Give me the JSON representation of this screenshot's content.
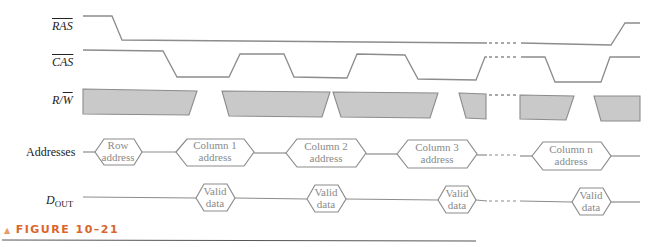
{
  "signals": {
    "ras": {
      "label": "RAS",
      "overbar": true
    },
    "cas": {
      "label": "CAS",
      "overbar": true
    },
    "rw": {
      "label_r": "R/",
      "label_w": "W",
      "overbar_on": "W"
    },
    "addresses": {
      "label": "Addresses"
    },
    "dout": {
      "label_main": "D",
      "label_sub": "OUT"
    }
  },
  "address_boxes": [
    {
      "line1": "Row",
      "line2": "address"
    },
    {
      "line1": "Column 1",
      "line2": "address"
    },
    {
      "line1": "Column 2",
      "line2": "address"
    },
    {
      "line1": "Column 3",
      "line2": "address"
    },
    {
      "line1": "Column n",
      "line2": "address"
    }
  ],
  "data_boxes": [
    {
      "line1": "Valid",
      "line2": "data"
    },
    {
      "line1": "Valid",
      "line2": "data"
    },
    {
      "line1": "Valid",
      "line2": "data"
    },
    {
      "line1": "Valid",
      "line2": "data"
    }
  ],
  "caption": {
    "icon": "triangle-up-icon",
    "text": "FIGURE 10–21"
  },
  "colors": {
    "waveform": "#8c8c8c",
    "shaded": "#c9c9c9",
    "caption": "#d9662b"
  }
}
